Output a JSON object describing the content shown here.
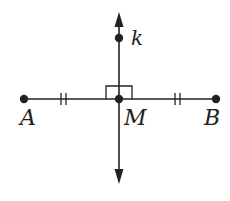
{
  "diagram": {
    "type": "geometry-perpendicular-bisector",
    "stroke_color": "#222222",
    "background": "#ffffff",
    "segment": {
      "name": "AB",
      "endpoints": [
        "A",
        "B"
      ],
      "midpoint": "M",
      "congruence_marks": "double tick on AM and MB"
    },
    "line": {
      "name": "k",
      "perpendicular_to": "AB",
      "passes_through": "M",
      "arrows": [
        "up",
        "down"
      ]
    },
    "right_angle_marker_at": "M",
    "points": [
      {
        "id": "A",
        "label": "A",
        "x": 24,
        "y": 99
      },
      {
        "id": "M",
        "label": "M",
        "x": 119,
        "y": 99
      },
      {
        "id": "B",
        "label": "B",
        "x": 216,
        "y": 99
      },
      {
        "id": "k",
        "label": "k",
        "x": 119,
        "y": 38
      }
    ],
    "labels": {
      "A": "A",
      "M": "M",
      "B": "B",
      "k": "k"
    }
  }
}
